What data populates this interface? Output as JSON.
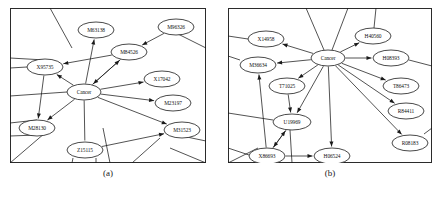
{
  "figure": {
    "type": "two-panel-network-diagram",
    "panels": [
      {
        "id": "a",
        "caption": "(a)",
        "center_node": "Cancer",
        "nodes": [
          {
            "id": "M63138",
            "label": "M63138",
            "cx": 86,
            "cy": 22,
            "rx": 18,
            "ry": 8
          },
          {
            "id": "M96326",
            "label": "M96326",
            "cx": 166,
            "cy": 19,
            "rx": 18,
            "ry": 8
          },
          {
            "id": "M84526",
            "label": "M84526",
            "cx": 119,
            "cy": 44,
            "rx": 18,
            "ry": 8
          },
          {
            "id": "X95735",
            "label": "X95735",
            "cx": 35,
            "cy": 59,
            "rx": 18,
            "ry": 8
          },
          {
            "id": "Cancer",
            "label": "Cancer",
            "cx": 74,
            "cy": 84,
            "rx": 17,
            "ry": 8
          },
          {
            "id": "X17042",
            "label": "X17042",
            "cx": 152,
            "cy": 71,
            "rx": 18,
            "ry": 8
          },
          {
            "id": "M23197",
            "label": "M23197",
            "cx": 163,
            "cy": 95,
            "rx": 18,
            "ry": 8
          },
          {
            "id": "M31523",
            "label": "M31523",
            "cx": 172,
            "cy": 122,
            "rx": 18,
            "ry": 8
          },
          {
            "id": "M28130",
            "label": "M28130",
            "cx": 27,
            "cy": 120,
            "rx": 18,
            "ry": 8
          },
          {
            "id": "Z15115",
            "label": "Z15115",
            "cx": 75,
            "cy": 142,
            "rx": 18,
            "ry": 8
          }
        ],
        "edges": [
          {
            "from": "Cancer",
            "to": "M63138",
            "arrow": true
          },
          {
            "from": "Cancer",
            "to": "M84526",
            "arrow": true
          },
          {
            "from": "M84526",
            "to": "Cancer",
            "arrow": true
          },
          {
            "from": "M96326",
            "to": "M84526",
            "arrow": true
          },
          {
            "from": "M84526",
            "to": "X95735",
            "arrow": true
          },
          {
            "from": "Cancer",
            "to": "X95735",
            "arrow": true
          },
          {
            "from": "Cancer",
            "to": "X17042",
            "arrow": true
          },
          {
            "from": "Cancer",
            "to": "M23197",
            "arrow": true
          },
          {
            "from": "Cancer",
            "to": "M31523",
            "arrow": true
          },
          {
            "from": "Cancer",
            "to": "M28130",
            "arrow": true
          },
          {
            "from": "X95735",
            "to": "M28130",
            "arrow": true
          },
          {
            "from": "Cancer",
            "to": "Z15115",
            "arrow": false
          },
          {
            "from": "Z15115",
            "to": "M31523",
            "arrow": true
          }
        ]
      },
      {
        "id": "b",
        "caption": "(b)",
        "center_node": "Cancer",
        "nodes": [
          {
            "id": "X14958",
            "label": "X14958",
            "cx": 38,
            "cy": 31,
            "rx": 18,
            "ry": 8
          },
          {
            "id": "H40560",
            "label": "H40560",
            "cx": 145,
            "cy": 28,
            "rx": 18,
            "ry": 8
          },
          {
            "id": "Cancer",
            "label": "Cancer",
            "cx": 100,
            "cy": 50,
            "rx": 17,
            "ry": 8
          },
          {
            "id": "H08393",
            "label": "H08393",
            "cx": 163,
            "cy": 50,
            "rx": 18,
            "ry": 8
          },
          {
            "id": "M36634",
            "label": "M36634",
            "cx": 30,
            "cy": 57,
            "rx": 18,
            "ry": 8
          },
          {
            "id": "T86473",
            "label": "T86473",
            "cx": 173,
            "cy": 78,
            "rx": 18,
            "ry": 8
          },
          {
            "id": "T71025",
            "label": "T71025",
            "cx": 59,
            "cy": 78,
            "rx": 18,
            "ry": 8
          },
          {
            "id": "R84411",
            "label": "R84411",
            "cx": 178,
            "cy": 103,
            "rx": 18,
            "ry": 8
          },
          {
            "id": "U19969",
            "label": "U19969",
            "cx": 64,
            "cy": 114,
            "rx": 19,
            "ry": 8
          },
          {
            "id": "R08183",
            "label": "R08183",
            "cx": 182,
            "cy": 135,
            "rx": 18,
            "ry": 8
          },
          {
            "id": "X86693",
            "label": "X86693",
            "cx": 39,
            "cy": 148,
            "rx": 18,
            "ry": 8
          },
          {
            "id": "H06524",
            "label": "H06524",
            "cx": 104,
            "cy": 148,
            "rx": 18,
            "ry": 8
          }
        ],
        "edges": [
          {
            "from": "Cancer",
            "to": "X14958",
            "arrow": true
          },
          {
            "from": "Cancer",
            "to": "H40560",
            "arrow": true
          },
          {
            "from": "Cancer",
            "to": "H08393",
            "arrow": true
          },
          {
            "from": "Cancer",
            "to": "M36634",
            "arrow": true
          },
          {
            "from": "Cancer",
            "to": "T86473",
            "arrow": true
          },
          {
            "from": "Cancer",
            "to": "T71025",
            "arrow": true
          },
          {
            "from": "Cancer",
            "to": "R84411",
            "arrow": true
          },
          {
            "from": "Cancer",
            "to": "R08183",
            "arrow": true
          },
          {
            "from": "Cancer",
            "to": "U19969",
            "arrow": true
          },
          {
            "from": "Cancer",
            "to": "H06524",
            "arrow": true
          },
          {
            "from": "T71025",
            "to": "U19969",
            "arrow": true
          },
          {
            "from": "X86693",
            "to": "U19969",
            "arrow": true
          },
          {
            "from": "U19969",
            "to": "X86693",
            "arrow": true
          },
          {
            "from": "X86693",
            "to": "M36634",
            "arrow": true
          },
          {
            "from": "X86693",
            "to": "H06524",
            "arrow": true
          }
        ]
      }
    ]
  },
  "colors": {
    "ink": "#1a1a1a",
    "background": "#ffffff",
    "node_fill": "#ffffff"
  }
}
